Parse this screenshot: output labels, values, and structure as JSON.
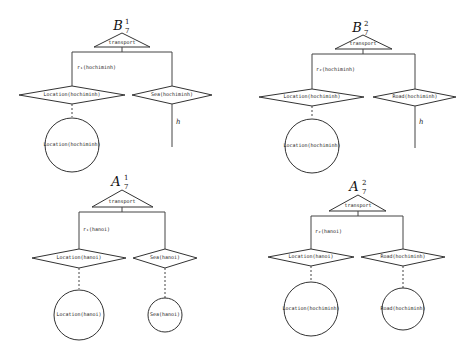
{
  "diagrams": [
    {
      "id": "B7_1",
      "title": "B",
      "title_sub": "7",
      "title_sup": "1",
      "root": "transport",
      "edge_label": "r₁(hochiminh)",
      "left_diamond": "Location(hochiminh)",
      "right_diamond": "Sea(hochiminh)",
      "left_circle": "Location(hochiminh)",
      "right_edge_label": "h"
    },
    {
      "id": "B7_2",
      "title": "B",
      "title_sub": "7",
      "title_sup": "2",
      "root": "transport",
      "edge_label": "r₂(hochiminh)",
      "left_diamond": "Location(hochiminh)",
      "right_diamond": "Road(hochiminh)",
      "left_circle": "Location(hochiminh)",
      "right_edge_label": "h"
    },
    {
      "id": "A7_1",
      "title": "A",
      "title_sub": "7",
      "title_sup": "1",
      "root": "transport",
      "edge_label": "r₁(hanoi)",
      "left_diamond": "Location(hanoi)",
      "right_diamond": "Sea(hanoi)",
      "left_circle": "Location(hanoi)",
      "right_circle": "Sea(hanoi)"
    },
    {
      "id": "A7_2",
      "title": "A",
      "title_sub": "7",
      "title_sup": "2",
      "root": "transport",
      "edge_label": "r₂(hanoi)",
      "left_diamond": "Location(hanoi)",
      "right_diamond": "Road(hochiminh)",
      "left_circle": "Location(hochiminh)",
      "right_circle": "Road(hochiminh)"
    }
  ]
}
